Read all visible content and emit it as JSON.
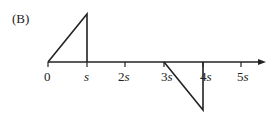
{
  "label": "(B)",
  "axis": {
    "ticks": [
      {
        "num": "0",
        "unit": ""
      },
      {
        "num": "",
        "unit": "s"
      },
      {
        "num": "2",
        "unit": "s"
      },
      {
        "num": "3",
        "unit": "s"
      },
      {
        "num": "4",
        "unit": "s"
      },
      {
        "num": "5",
        "unit": "s"
      }
    ]
  },
  "shapes": {
    "positive_triangle": "rises linearly from 0 to s, then drops vertically to 0 at s",
    "negative_triangle": "falls linearly from 3s to 4s, then returns vertically to 0 at 4s"
  }
}
